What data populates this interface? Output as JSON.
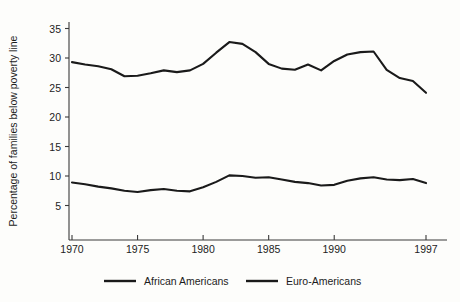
{
  "chart_data": {
    "type": "line",
    "title": "",
    "subtitle": "",
    "xlabel": "",
    "ylabel": "Percentage of families below poverty line",
    "xlim": [
      1970,
      1997
    ],
    "ylim": [
      0,
      37
    ],
    "yticks": [
      5,
      10,
      15,
      20,
      25,
      30,
      35
    ],
    "ytick_labels": [
      "5",
      "10",
      "15",
      "20",
      "25",
      "30",
      "35"
    ],
    "xticks": [
      1970,
      1975,
      1980,
      1985,
      1990,
      1997
    ],
    "xtick_labels": [
      "1970",
      "1975",
      "1980",
      "1985",
      "1990",
      "1997"
    ],
    "grid": false,
    "legend_position": "bottom",
    "x": [
      1970,
      1971,
      1972,
      1973,
      1974,
      1975,
      1976,
      1977,
      1978,
      1979,
      1980,
      1981,
      1982,
      1983,
      1984,
      1985,
      1986,
      1987,
      1988,
      1989,
      1990,
      1991,
      1992,
      1993,
      1994,
      1995,
      1996,
      1997
    ],
    "series": [
      {
        "name": "African Americans",
        "values": [
          29.3,
          28.9,
          28.6,
          28.1,
          26.9,
          27.0,
          27.4,
          27.9,
          27.6,
          27.9,
          29.0,
          30.9,
          32.7,
          32.4,
          31.0,
          29.0,
          28.2,
          28.0,
          28.9,
          27.9,
          29.5,
          30.6,
          31.0,
          31.1,
          28.0,
          26.6,
          26.1,
          24.1
        ]
      },
      {
        "name": "Euro-Americans",
        "values": [
          8.9,
          8.6,
          8.2,
          7.9,
          7.5,
          7.3,
          7.6,
          7.8,
          7.5,
          7.4,
          8.1,
          9.0,
          10.1,
          10.0,
          9.7,
          9.8,
          9.4,
          9.0,
          8.8,
          8.4,
          8.5,
          9.2,
          9.6,
          9.8,
          9.4,
          9.3,
          9.5,
          8.8
        ]
      }
    ]
  },
  "legend": {
    "entries": [
      {
        "label": "African Americans"
      },
      {
        "label": "Euro-Americans"
      }
    ]
  }
}
